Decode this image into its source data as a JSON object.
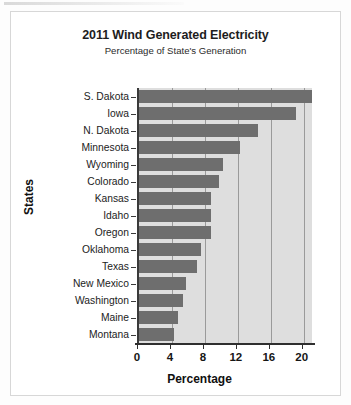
{
  "chart_data": {
    "type": "bar",
    "orientation": "horizontal",
    "title": "2011 Wind Generated Electricity",
    "subtitle": "Percentage of State's Generation",
    "xlabel": "Percentage",
    "ylabel": "States",
    "categories": [
      "S. Dakota",
      "Iowa",
      "N. Dakota",
      "Minnesota",
      "Wyoming",
      "Colorado",
      "Kansas",
      "Idaho",
      "Oregon",
      "Oklahoma",
      "Texas",
      "New Mexico",
      "Washington",
      "Maine",
      "Montana"
    ],
    "values": [
      21,
      19,
      14.5,
      12.3,
      10.2,
      9.7,
      8.7,
      8.7,
      8.7,
      7.5,
      7.0,
      5.7,
      5.3,
      4.7,
      4.3
    ],
    "xlim": [
      0,
      21
    ],
    "xticks": [
      0,
      4,
      8,
      12,
      16,
      20
    ],
    "xtick_labels": [
      "0",
      "4",
      "8",
      "12",
      "16",
      "20"
    ],
    "grid": true,
    "grid_axis": "x",
    "legend": null,
    "bar_color": "#6e6e6e",
    "plot_background": "#dedede",
    "axis_color": "#2f2f2f"
  }
}
